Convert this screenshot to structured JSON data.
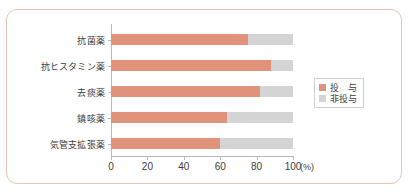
{
  "chart_data": {
    "type": "bar",
    "orientation": "horizontal",
    "stacked": true,
    "stack_mode": "percent",
    "title": "",
    "subtitle": "",
    "xlabel": "(%)",
    "ylabel": "",
    "xlim": [
      0,
      100
    ],
    "xticks": [
      0,
      20,
      40,
      60,
      80,
      100
    ],
    "xtick_labels": [
      "0",
      "20",
      "40",
      "60",
      "80",
      "100"
    ],
    "x_unit_label": "(%)",
    "grid": false,
    "legend_position": "right",
    "categories": [
      "抗菌薬",
      "抗ヒスタミン薬",
      "去痰薬",
      "鎮咳薬",
      "気管支拡張薬"
    ],
    "series": [
      {
        "name": "投　与",
        "color": "#e0927b",
        "values": [
          75,
          88,
          82,
          64,
          60
        ]
      },
      {
        "name": "非投与",
        "color": "#d4d4d4",
        "values": [
          25,
          12,
          18,
          36,
          40
        ]
      }
    ]
  },
  "legend": {
    "items": [
      {
        "label": "投　与",
        "color": "#e0927b"
      },
      {
        "label": "非投与",
        "color": "#d4d4d4"
      }
    ]
  },
  "colors": {
    "given": "#e0927b",
    "not_given": "#d4d4d4",
    "frame": "#e9c3b6",
    "axis": "#b9b9b9",
    "text": "#3c3c3c",
    "background": "#ffffff"
  }
}
